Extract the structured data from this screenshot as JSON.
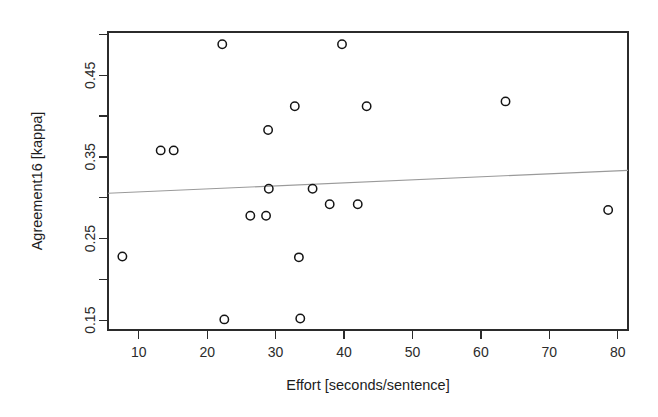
{
  "chart_data": {
    "type": "scatter",
    "title": "",
    "xlabel": "Effort [seconds/sentence]",
    "ylabel": "Agreement16 [kappa]",
    "xlim": [
      5.5,
      81.5
    ],
    "ylim": [
      0.138,
      0.503
    ],
    "grid": false,
    "legend": null,
    "xticks": [
      10,
      20,
      30,
      40,
      50,
      60,
      70,
      80
    ],
    "xticklabels": [
      "10",
      "20",
      "30",
      "40",
      "50",
      "60",
      "70",
      "80"
    ],
    "yticks": [
      0.15,
      0.2,
      0.25,
      0.3,
      0.35,
      0.4,
      0.45,
      0.5
    ],
    "yticklabels": [
      "0.15",
      "",
      "0.25",
      "",
      "0.35",
      "",
      "0.45",
      ""
    ],
    "marker": "open-circle",
    "points": [
      {
        "x": 7.6,
        "y": 0.228
      },
      {
        "x": 13.2,
        "y": 0.358
      },
      {
        "x": 15.1,
        "y": 0.358
      },
      {
        "x": 22.2,
        "y": 0.488
      },
      {
        "x": 22.5,
        "y": 0.151
      },
      {
        "x": 26.3,
        "y": 0.278
      },
      {
        "x": 28.6,
        "y": 0.278
      },
      {
        "x": 28.9,
        "y": 0.383
      },
      {
        "x": 29.0,
        "y": 0.311
      },
      {
        "x": 32.8,
        "y": 0.412
      },
      {
        "x": 33.4,
        "y": 0.227
      },
      {
        "x": 33.6,
        "y": 0.152
      },
      {
        "x": 35.4,
        "y": 0.311
      },
      {
        "x": 37.9,
        "y": 0.292
      },
      {
        "x": 39.7,
        "y": 0.488
      },
      {
        "x": 42.0,
        "y": 0.292
      },
      {
        "x": 43.3,
        "y": 0.412
      },
      {
        "x": 63.6,
        "y": 0.418
      },
      {
        "x": 78.6,
        "y": 0.285
      }
    ],
    "trendline": {
      "name": "linear fit",
      "x0": 5.5,
      "y0": 0.3055,
      "x1": 81.5,
      "y1": 0.3335,
      "color": "#9a9a9a"
    }
  },
  "axes": {
    "x_axis_name": "effort-axis",
    "y_axis_name": "agreement-axis"
  }
}
